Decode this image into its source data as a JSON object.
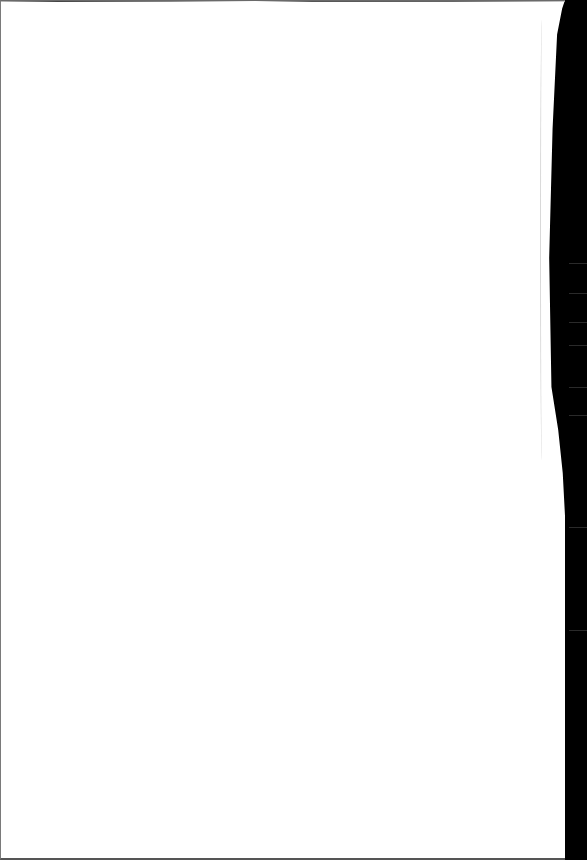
{
  "document": {
    "type": "scanned-page",
    "content_text": "",
    "is_blank": true
  },
  "colors": {
    "page": "#ffffff",
    "background": "#000000",
    "edge": "#666666"
  }
}
